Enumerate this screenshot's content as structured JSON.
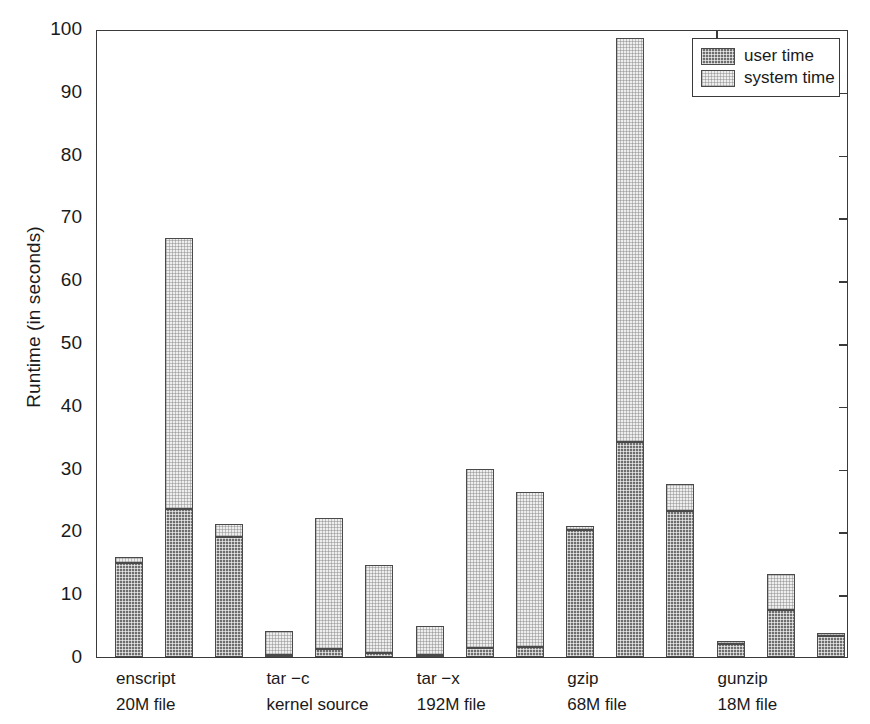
{
  "chart_data": {
    "type": "bar",
    "subtype": "grouped-stacked",
    "title": "",
    "xlabel": "",
    "ylabel": "Runtime (in seconds)",
    "ylim": [
      0,
      100
    ],
    "yticks": [
      0,
      10,
      20,
      30,
      40,
      50,
      60,
      70,
      80,
      90,
      100
    ],
    "ytick_labels": [
      "0",
      "10",
      "20",
      "30",
      "40",
      "50",
      "60",
      "70",
      "80",
      "90",
      "100"
    ],
    "grid": false,
    "legend_position": "top-right",
    "legend": [
      "user time",
      "system time"
    ],
    "series": [
      {
        "name": "user time",
        "swatch": "dark-checker",
        "color": "#6e6e6e"
      },
      {
        "name": "system time",
        "swatch": "light-checker",
        "color": "#eeeeee"
      }
    ],
    "categories": [
      {
        "line1": "enscript",
        "line2": "20M file"
      },
      {
        "line1": "tar −c",
        "line2": "kernel source"
      },
      {
        "line1": "tar −x",
        "line2": "192M file"
      },
      {
        "line1": "gzip",
        "line2": "68M file"
      },
      {
        "line1": "gunzip",
        "line2": "18M file"
      }
    ],
    "bars": [
      {
        "group": "enscript",
        "index": 0,
        "user": 15.0,
        "system": 1.0,
        "total": 16.0
      },
      {
        "group": "enscript",
        "index": 1,
        "user": 23.6,
        "system": 43.1,
        "total": 66.7
      },
      {
        "group": "enscript",
        "index": 2,
        "user": 19.1,
        "system": 2.1,
        "total": 21.2
      },
      {
        "group": "tar -c",
        "index": 0,
        "user": 0.3,
        "system": 3.9,
        "total": 4.2
      },
      {
        "group": "tar -c",
        "index": 1,
        "user": 1.3,
        "system": 20.9,
        "total": 22.2
      },
      {
        "group": "tar -c",
        "index": 2,
        "user": 0.7,
        "system": 14.0,
        "total": 14.7
      },
      {
        "group": "tar -x",
        "index": 0,
        "user": 0.3,
        "system": 4.7,
        "total": 5.0
      },
      {
        "group": "tar -x",
        "index": 1,
        "user": 1.5,
        "system": 28.4,
        "total": 29.9
      },
      {
        "group": "tar -x",
        "index": 2,
        "user": 1.6,
        "system": 24.7,
        "total": 26.3
      },
      {
        "group": "gzip",
        "index": 0,
        "user": 20.2,
        "system": 0.6,
        "total": 20.8
      },
      {
        "group": "gzip",
        "index": 1,
        "user": 34.3,
        "system": 64.3,
        "total": 98.6
      },
      {
        "group": "gzip",
        "index": 2,
        "user": 23.2,
        "system": 4.4,
        "total": 27.6
      },
      {
        "group": "gunzip",
        "index": 0,
        "user": 2.1,
        "system": 0.5,
        "total": 2.6
      },
      {
        "group": "gunzip",
        "index": 1,
        "user": 7.5,
        "system": 5.7,
        "total": 13.2
      },
      {
        "group": "gunzip",
        "index": 2,
        "user": 3.4,
        "system": 0.4,
        "total": 3.8
      }
    ]
  },
  "axis": {
    "y_label": "Runtime (in seconds)"
  }
}
